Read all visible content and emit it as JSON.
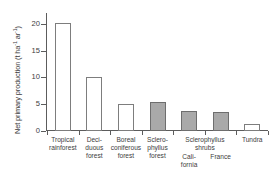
{
  "chart_data": {
    "type": "bar",
    "title": "",
    "xlabel": "",
    "ylabel": "Net primary production (t ha⁻¹ ar⁻¹)",
    "ylabel_parts": {
      "text_main": "Net primary production (t ha",
      "sup1": "-1",
      "text_mid": " ar",
      "sup2": "-1",
      "text_end": ")"
    },
    "ylim": [
      0,
      22
    ],
    "yticks": [
      0,
      5,
      10,
      15,
      20
    ],
    "ytick_labels": [
      "0",
      "5",
      "10",
      "15",
      "20"
    ],
    "grid": false,
    "legend": "none",
    "categories": [
      "Tropical rainforest",
      "Deciduous forest",
      "Boreal coniferous forest",
      "Sclerophyllus forest",
      "Sclerophyllus shrubs California",
      "Sclerophyllus shrubs France",
      "Tundra"
    ],
    "values": [
      20.2,
      10.0,
      5.1,
      5.5,
      3.7,
      3.6,
      1.4
    ],
    "fills": [
      "open",
      "open",
      "open",
      "filled",
      "filled",
      "filled",
      "open"
    ],
    "colors": {
      "open_fill": "#ffffff",
      "filled_fill": "#a9a9a9",
      "bar_border": "#7d7d7d",
      "axis": "#5c5c5c",
      "text": "#3d3d3d",
      "background": "#ffffff"
    }
  },
  "axis": {
    "ticks": [
      {
        "label": "20",
        "value": 20
      },
      {
        "label": "15",
        "value": 15
      },
      {
        "label": "10",
        "value": 10
      },
      {
        "label": "5",
        "value": 5
      },
      {
        "label": "0",
        "value": 0
      }
    ]
  },
  "category_labels": [
    {
      "lines": [
        "Tropical",
        "rainforest"
      ]
    },
    {
      "lines": [
        "Deci-",
        "duous",
        "forest"
      ]
    },
    {
      "lines": [
        "Boreal",
        "coniferous",
        "forest"
      ]
    },
    {
      "lines": [
        "Sclero-",
        "phyllus",
        "forest"
      ]
    },
    {
      "lines": [
        "Cali-",
        "fornia"
      ]
    },
    {
      "lines": [
        "France"
      ]
    },
    {
      "lines": [
        "Tundra"
      ]
    }
  ],
  "group_label": {
    "lines": [
      "Sclerophyllus",
      "shrubs"
    ]
  }
}
